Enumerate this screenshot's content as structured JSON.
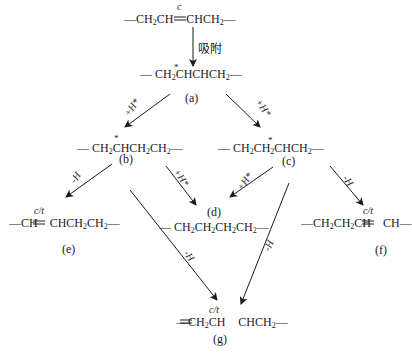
{
  "diagram": {
    "start": {
      "formula": "—CH₂CH═CHCH₂—",
      "bond_mark": "c"
    },
    "adsorb_label": "吸附",
    "nodes": {
      "a": {
        "tag": "(a)",
        "formula": "—CH₂ĊHCHCH₂—",
        "radical_mark": "*"
      },
      "b": {
        "tag": "(b)",
        "formula": "—CH₂ĊHCH₂CH₂—",
        "radical_mark": "*"
      },
      "c": {
        "tag": "(c)",
        "formula": "—CH₂CH₂ĊHCH₂—",
        "radical_mark": "*"
      },
      "d": {
        "tag": "(d)",
        "formula": "—CH₂CH₂CH₂CH₂—"
      },
      "e": {
        "tag": "(e)",
        "formula": "—CH═CHCH₂CH₂—",
        "bond_mark": "c/t"
      },
      "f": {
        "tag": "(f)",
        "formula": "—CH₂CH₂CH═CH—",
        "bond_mark": "c/t"
      },
      "g": {
        "tag": "(g)",
        "formula": "—CH₂CH═CHCH₂—",
        "bond_mark": "c/t"
      }
    },
    "edges": [
      {
        "from": "start",
        "to": "a",
        "label": "吸附"
      },
      {
        "from": "a",
        "to": "b",
        "label": "+H*"
      },
      {
        "from": "a",
        "to": "c",
        "label": "+H*"
      },
      {
        "from": "b",
        "to": "e",
        "label": "-H"
      },
      {
        "from": "b",
        "to": "d",
        "label": "+H*"
      },
      {
        "from": "b",
        "to": "g",
        "label": "-H"
      },
      {
        "from": "c",
        "to": "d",
        "label": "+H*"
      },
      {
        "from": "c",
        "to": "f",
        "label": "-H"
      },
      {
        "from": "c",
        "to": "g",
        "label": "-H"
      }
    ],
    "text": {
      "start_pre": "—CH",
      "start_s1": "2",
      "start_mid": "CH",
      "start_post": "CHCH",
      "start_s2": "2",
      "start_end": "—",
      "c_mark": "c",
      "ct_mark": "c/t",
      "star": "*",
      "plus_h": "+H*",
      "minus_h": "-H",
      "a_p1": "— CH",
      "a_s1": "2",
      "a_p2": "CHCHCH",
      "a_s2": "2",
      "a_p3": "—",
      "b_p1": "— CH",
      "b_s1": "2",
      "b_p2": "CHCH",
      "b_s2": "2",
      "b_p3": "CH",
      "b_s3": "2",
      "b_p4": "—",
      "c_p1": "— CH",
      "c_s1": "2",
      "c_p2": "CH",
      "c_s2": "2",
      "c_p3": "CHCH",
      "c_s3": "2",
      "c_p4": "—",
      "d_p1": "— CH",
      "d_s1": "2",
      "d_p2": "CH",
      "d_s2": "2",
      "d_p3": "CH",
      "d_s3": "2",
      "d_p4": "CH",
      "d_s4": "2",
      "d_p5": "—",
      "e_p1": "—CH",
      "e_p2": "CHCH",
      "e_s1": "2",
      "e_p3": "CH",
      "e_s2": "2",
      "e_p4": "—",
      "f_p1": "—CH",
      "f_s1": "2",
      "f_p2": "CH",
      "f_s2": "2",
      "f_p3": "CH",
      "f_p4": "CH—",
      "g_p1": "—CH",
      "g_s1": "2",
      "g_p2": "CH",
      "g_p3": "CHCH",
      "g_s2": "2",
      "g_p4": "—"
    }
  }
}
